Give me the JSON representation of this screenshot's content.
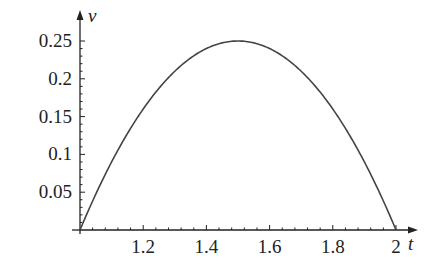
{
  "chart_data": {
    "type": "line",
    "title": "",
    "xlabel": "t",
    "ylabel": "v",
    "xlim": [
      1.0,
      2.0
    ],
    "ylim": [
      0,
      0.25
    ],
    "grid": false,
    "legend": null,
    "x_ticks": [
      "1.2",
      "1.4",
      "1.6",
      "1.8",
      "2"
    ],
    "y_ticks": [
      "0.05",
      "0.1",
      "0.15",
      "0.2",
      "0.25"
    ],
    "series": [
      {
        "name": "v(t)",
        "expression": "(t-1)(2-t)",
        "x": [
          1.0,
          1.1,
          1.2,
          1.3,
          1.4,
          1.5,
          1.6,
          1.7,
          1.8,
          1.9,
          2.0
        ],
        "values": [
          0,
          0.09,
          0.16,
          0.21,
          0.24,
          0.25,
          0.24,
          0.21,
          0.16,
          0.09,
          0
        ]
      }
    ]
  },
  "colors": {
    "curve": "#444444",
    "axis": "#222222"
  }
}
